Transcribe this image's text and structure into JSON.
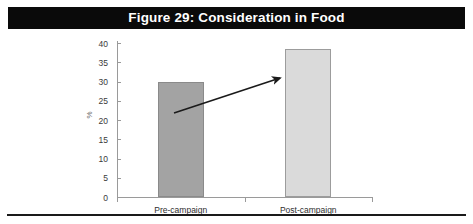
{
  "figure": {
    "title": "Figure 29: Consideration in Food",
    "title_bar_color": "#0a0a0a",
    "title_text_color": "#ffffff"
  },
  "chart_data": {
    "type": "bar",
    "title": "Figure 29: Consideration in Food",
    "xlabel": "",
    "ylabel": "%",
    "categories": [
      "Pre-campaign",
      "Post-campaign"
    ],
    "values": [
      30,
      38.5
    ],
    "ylim": [
      0,
      40
    ],
    "yticks": [
      0,
      5,
      10,
      15,
      20,
      25,
      30,
      35,
      40
    ],
    "ytick_labels": [
      "0",
      "5",
      "10",
      "15",
      "20",
      "25",
      "30",
      "35",
      "40"
    ],
    "grid": false,
    "legend": false,
    "bar_colors": [
      "#a3a3a3",
      "#dadada"
    ],
    "bar_edge_colors": [
      "#8a8a8a",
      "#9c9c9c"
    ],
    "annotations": [
      {
        "type": "arrow",
        "label": "growth-arrow",
        "direction": "up-right",
        "color": "#1a1a1a"
      }
    ]
  }
}
